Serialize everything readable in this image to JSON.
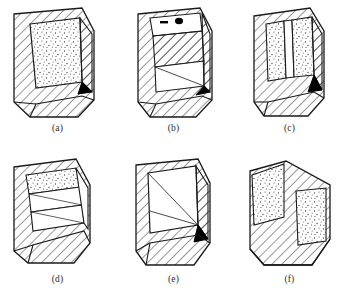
{
  "figure": {
    "type": "technical-line-diagram",
    "background_color": "#ffffff",
    "line_color": "#1a1a1a",
    "stipple_color": "#555555",
    "solid_marker_color": "#000000",
    "rows": 2,
    "columns": 3
  },
  "panels": [
    {
      "id": "a",
      "caption": "(a)",
      "fill_regions": [
        "hatched-frame",
        "stippled-face"
      ],
      "has_black_wedge": true,
      "black_wedge_position": "lower-right"
    },
    {
      "id": "b",
      "caption": "(b)",
      "fill_regions": [
        "hatched-frame",
        "hatched-inner-band",
        "white-recess"
      ],
      "has_black_wedge": true,
      "black_wedge_position": "lower-right",
      "markers": [
        "black-dot",
        "black-bar"
      ]
    },
    {
      "id": "c",
      "caption": "(c)",
      "fill_regions": [
        "hatched-frame",
        "stippled-left-column",
        "white-slot",
        "stippled-right-column"
      ],
      "has_black_wedge": true,
      "black_wedge_position": "lower-right"
    },
    {
      "id": "d",
      "caption": "(d)",
      "fill_regions": [
        "hatched-frame",
        "stippled-top-band",
        "white-middle-band",
        "hatched-lower"
      ],
      "has_black_wedge": false
    },
    {
      "id": "e",
      "caption": "(e)",
      "fill_regions": [
        "hatched-frame",
        "white-recess",
        "diagonal-lines"
      ],
      "has_black_wedge": true,
      "black_wedge_position": "lower-right"
    },
    {
      "id": "f",
      "caption": "(f)",
      "fill_regions": [
        "stippled-left-panel",
        "hatched-diagonal-band",
        "stippled-right-panel"
      ],
      "has_black_wedge": false
    }
  ]
}
